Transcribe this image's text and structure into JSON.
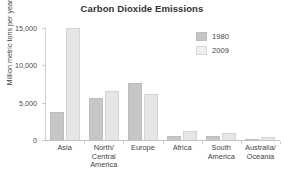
{
  "chart_data": {
    "type": "bar",
    "title": "Carbon Dioxide Emissions",
    "xlabel": "",
    "ylabel": "Million metric tons per year",
    "categories": [
      "Asia",
      "North/ Central America",
      "Europe",
      "Africa",
      "South America",
      "Australia/ Oceania"
    ],
    "category_lines": [
      [
        "Asia"
      ],
      [
        "North/",
        "Central",
        "America"
      ],
      [
        "Europe"
      ],
      [
        "Africa"
      ],
      [
        "South",
        "America"
      ],
      [
        "Australia/",
        "Oceania"
      ]
    ],
    "series": [
      {
        "name": "1980",
        "color": "#c6c6c6",
        "values": [
          3800,
          5600,
          7700,
          600,
          500,
          200
        ]
      },
      {
        "name": "2009",
        "color": "#e6e6e6",
        "values": [
          15000,
          6600,
          6200,
          1200,
          1000,
          450
        ]
      }
    ],
    "ylim": [
      0,
      15000
    ],
    "yticks": [
      0,
      5000,
      10000,
      15000
    ],
    "ytick_labels": [
      "0",
      "5,000",
      "10,000",
      "15,000"
    ],
    "grid": false,
    "legend_position": "top-right"
  }
}
